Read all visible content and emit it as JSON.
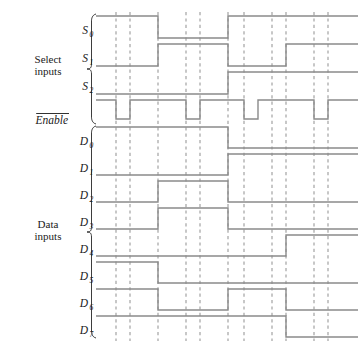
{
  "figure": {
    "type": "timing-diagram",
    "background": "#ffffff",
    "wave_color": "#8a8a8a",
    "grid_color": "#9a9a9a",
    "text_color": "#1a1a1a"
  },
  "groups": [
    {
      "id": "select",
      "line1": "Select",
      "line2": "inputs"
    },
    {
      "id": "data",
      "line1": "Data",
      "line2": "inputs"
    }
  ],
  "axis": {
    "x_start": 96,
    "x_end": 358,
    "grid_x": [
      116,
      130,
      158,
      186,
      200,
      228,
      244,
      272,
      286,
      314,
      328
    ],
    "grid_top": 12,
    "grid_bottom": 341
  },
  "signals": [
    {
      "name": "S0",
      "label": "S",
      "subscript": "0",
      "overbar": false,
      "group": "select",
      "row_top": 16,
      "row_bottom": 38,
      "label_x": 88,
      "label_y": 34,
      "initial": 1,
      "transitions": [
        {
          "x": 158,
          "level": 0
        },
        {
          "x": 228,
          "level": 1
        }
      ]
    },
    {
      "name": "S1",
      "label": "S",
      "subscript": "1",
      "overbar": false,
      "group": "select",
      "row_top": 44,
      "row_bottom": 66,
      "label_x": 88,
      "label_y": 62,
      "initial": 0,
      "transitions": [
        {
          "x": 158,
          "level": 1
        },
        {
          "x": 228,
          "level": 0
        },
        {
          "x": 286,
          "level": 1
        }
      ]
    },
    {
      "name": "S2",
      "label": "S",
      "subscript": "2",
      "overbar": false,
      "group": "select",
      "row_top": 72,
      "row_bottom": 94,
      "label_x": 88,
      "label_y": 90,
      "initial": 0,
      "transitions": [
        {
          "x": 228,
          "level": 1
        }
      ]
    },
    {
      "name": "Enable",
      "label": "Enable",
      "subscript": "",
      "overbar": true,
      "group": "select",
      "row_top": 100,
      "row_bottom": 119,
      "label_x": 68,
      "label_y": 124,
      "initial": 1,
      "transitions": [
        {
          "x": 116,
          "level": 0
        },
        {
          "x": 130,
          "level": 1
        },
        {
          "x": 186,
          "level": 0
        },
        {
          "x": 200,
          "level": 1
        },
        {
          "x": 244,
          "level": 0
        },
        {
          "x": 258,
          "level": 1
        },
        {
          "x": 314,
          "level": 0
        },
        {
          "x": 328,
          "level": 1
        }
      ]
    },
    {
      "name": "D0",
      "label": "D",
      "subscript": "0",
      "overbar": false,
      "group": "data",
      "row_top": 127,
      "row_bottom": 148,
      "label_x": 88,
      "label_y": 145,
      "initial": 1,
      "transitions": [
        {
          "x": 228,
          "level": 0
        }
      ]
    },
    {
      "name": "D1",
      "label": "D",
      "subscript": "1",
      "overbar": false,
      "group": "data",
      "row_top": 154,
      "row_bottom": 175,
      "label_x": 88,
      "label_y": 172,
      "initial": 0,
      "transitions": [
        {
          "x": 228,
          "level": 1
        }
      ]
    },
    {
      "name": "D2",
      "label": "D",
      "subscript": "2",
      "overbar": false,
      "group": "data",
      "row_top": 181,
      "row_bottom": 202,
      "label_x": 88,
      "label_y": 199,
      "initial": 0,
      "transitions": [
        {
          "x": 158,
          "level": 1
        },
        {
          "x": 228,
          "level": 0
        }
      ]
    },
    {
      "name": "D3",
      "label": "D",
      "subscript": "3",
      "overbar": false,
      "group": "data",
      "row_top": 208,
      "row_bottom": 229,
      "label_x": 88,
      "label_y": 226,
      "initial": 0,
      "transitions": [
        {
          "x": 158,
          "level": 1
        },
        {
          "x": 228,
          "level": 0
        }
      ]
    },
    {
      "name": "D4",
      "label": "D",
      "subscript": "4",
      "overbar": false,
      "group": "data",
      "row_top": 235,
      "row_bottom": 256,
      "label_x": 88,
      "label_y": 253,
      "initial": 0,
      "transitions": [
        {
          "x": 286,
          "level": 1
        }
      ]
    },
    {
      "name": "D5",
      "label": "D",
      "subscript": "5",
      "overbar": false,
      "group": "data",
      "row_top": 262,
      "row_bottom": 283,
      "label_x": 88,
      "label_y": 280,
      "initial": 1,
      "transitions": [
        {
          "x": 158,
          "level": 0
        }
      ]
    },
    {
      "name": "D6",
      "label": "D",
      "subscript": "6",
      "overbar": false,
      "group": "data",
      "row_top": 289,
      "row_bottom": 310,
      "label_x": 88,
      "label_y": 307,
      "initial": 1,
      "transitions": [
        {
          "x": 158,
          "level": 0
        },
        {
          "x": 228,
          "level": 1
        },
        {
          "x": 286,
          "level": 0
        }
      ]
    },
    {
      "name": "D7",
      "label": "D",
      "subscript": "7",
      "overbar": false,
      "group": "data",
      "row_top": 316,
      "row_bottom": 337,
      "label_x": 88,
      "label_y": 334,
      "initial": 1,
      "transitions": [
        {
          "x": 286,
          "level": 0
        }
      ]
    }
  ],
  "braces": [
    {
      "id": "select-brace",
      "x": 96,
      "y_top": 14,
      "y_bottom": 124,
      "label_x": 48,
      "label_y": 63
    },
    {
      "id": "data-brace",
      "x": 96,
      "y_top": 126,
      "y_bottom": 338,
      "label_x": 48,
      "label_y": 228
    }
  ]
}
